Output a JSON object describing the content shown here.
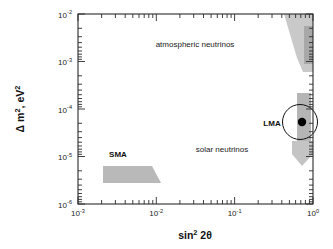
{
  "figure": {
    "background": "#ffffff",
    "frame_color": "#2b2b2b"
  },
  "chart_data": {
    "type": "scatter",
    "title": "",
    "subtitle": "",
    "xlabel": "sin² 2θ",
    "ylabel": "Δ m², eV²",
    "xscale": "log",
    "yscale": "log",
    "xlim": [
      0.001,
      1.0
    ],
    "ylim": [
      1e-06,
      0.01
    ],
    "grid": false,
    "legend": "none",
    "xticks": [
      0.001,
      0.01,
      0.1,
      1.0
    ],
    "xtick_labels": [
      "10⁻³",
      "10⁻²",
      "10⁻¹",
      "10⁰"
    ],
    "yticks": [
      0.01,
      0.001,
      0.0001,
      1e-05,
      1e-06
    ],
    "ytick_labels": [
      "10⁻²",
      "10⁻³",
      "10⁻⁴",
      "10⁻⁵",
      "10⁻⁶"
    ],
    "annotations": [
      {
        "text": "atmospheric neutrinos",
        "x": 0.035,
        "y": 0.0033
      },
      {
        "text": "solar neutrinos",
        "x": 0.1,
        "y": 2.2e-05
      },
      {
        "text": "SMA",
        "x": 0.0034,
        "y": 1.75e-05
      },
      {
        "text": "LMA",
        "x": 0.4,
        "y": 5e-05
      }
    ],
    "regions": [
      {
        "name": "atmospheric-neutrinos-region",
        "fill": "#c9c9c9",
        "description": "wedge narrowing downward from top-right",
        "vertices_pixels": "284,14 313,14 313,70 302,70 296,56"
      },
      {
        "name": "atmospheric-neutrinos-core",
        "fill": "#a8a8a8",
        "description": "darker inner core band near right edge",
        "vertices_pixels": "305,28 313,28 313,62 305,62"
      },
      {
        "name": "lma-solar-band",
        "fill": "#b5b5b5",
        "description": "vertical band containing LMA best fit",
        "vertices_pixels": "297,93 311,93 311,140 297,140"
      },
      {
        "name": "solar-lower-wedge",
        "fill": "#c4c4c4",
        "description": "pentagon arrow pointing down below LMA",
        "vertices_pixels": "292,140 313,140 313,155 303,166 292,155"
      },
      {
        "name": "sma-region",
        "fill": "#b9b9b9",
        "description": "trapezoid for small mixing angle solution",
        "vertices_pixels": "103,166 152,166 161,183 103,183"
      }
    ],
    "points": [
      {
        "name": "lma-best-fit-point",
        "x": 0.8,
        "y": 5.5e-05,
        "marker": "filled-circle",
        "color": "#000000",
        "radius_px": 4.2
      }
    ],
    "shapes": [
      {
        "name": "lma-contour-circle",
        "type": "circle",
        "center_px": [
          300,
          122
        ],
        "radius_px": 17.5,
        "stroke": "#111111",
        "fill": "none"
      }
    ]
  }
}
